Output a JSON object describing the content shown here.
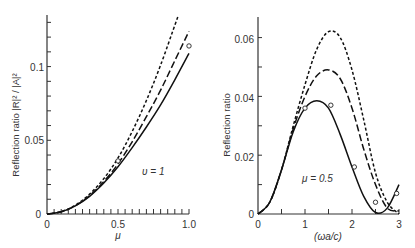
{
  "chart_data": [
    {
      "type": "line",
      "title": "",
      "xlabel": "μ",
      "ylabel": "Reflection ratio |R|² / |A|²",
      "xlim": [
        0,
        1.0
      ],
      "ylim": [
        0,
        0.135
      ],
      "x_ticks": [
        "0",
        "0.5",
        "1.0"
      ],
      "y_ticks": [
        "0",
        "0.05",
        "0.1"
      ],
      "grid": false,
      "annotation": "υ = 1",
      "x": [
        0,
        0.1,
        0.2,
        0.3,
        0.4,
        0.5,
        0.6,
        0.7,
        0.8,
        0.9,
        1.0
      ],
      "series": [
        {
          "name": "solid",
          "style": "solid",
          "values": [
            0,
            0.0015,
            0.0055,
            0.012,
            0.021,
            0.032,
            0.045,
            0.059,
            0.074,
            0.091,
            0.109
          ]
        },
        {
          "name": "long-dash",
          "style": "long-dash",
          "values": [
            0,
            0.0015,
            0.0056,
            0.0125,
            0.022,
            0.034,
            0.049,
            0.066,
            0.084,
            0.104,
            0.124
          ]
        },
        {
          "name": "short-dash",
          "style": "short-dash",
          "values": [
            0,
            0.0016,
            0.006,
            0.0135,
            0.024,
            0.038,
            0.056,
            0.077,
            0.101,
            0.128,
            null
          ]
        }
      ],
      "points": [
        {
          "x": 0.5,
          "y": 0.036
        },
        {
          "x": 1.0,
          "y": 0.114
        }
      ]
    },
    {
      "type": "line",
      "title": "",
      "xlabel": "(ωa/c)",
      "ylabel": "Reflection ratio",
      "xlim": [
        0,
        3
      ],
      "ylim": [
        0,
        0.067
      ],
      "x_ticks": [
        "0",
        "1",
        "2",
        "3"
      ],
      "y_ticks": [
        "0",
        "0.02",
        "0.04",
        "0.06"
      ],
      "grid": false,
      "annotation": "μ = 0.5",
      "x": [
        0,
        0.25,
        0.5,
        0.75,
        1.0,
        1.25,
        1.5,
        1.75,
        2.0,
        2.25,
        2.5,
        2.75,
        3.0
      ],
      "series": [
        {
          "name": "solid",
          "style": "solid",
          "values": [
            0,
            0.004,
            0.015,
            0.028,
            0.036,
            0.0385,
            0.036,
            0.027,
            0.016,
            0.006,
            0.0005,
            0.002,
            0.01
          ]
        },
        {
          "name": "long-dash",
          "style": "long-dash",
          "values": [
            0,
            0.004,
            0.015,
            0.029,
            0.04,
            0.047,
            0.049,
            0.046,
            0.036,
            0.022,
            0.01,
            0.002,
            0.001
          ]
        },
        {
          "name": "short-dash",
          "style": "short-dash",
          "values": [
            0,
            0.004,
            0.015,
            0.03,
            0.044,
            0.056,
            0.062,
            0.06,
            0.049,
            0.032,
            0.014,
            0.004,
            0.0
          ]
        }
      ],
      "points": [
        {
          "x": 1.0,
          "y": 0.036
        },
        {
          "x": 1.55,
          "y": 0.037
        },
        {
          "x": 2.05,
          "y": 0.016
        },
        {
          "x": 2.5,
          "y": 0.004
        },
        {
          "x": 2.95,
          "y": 0.007
        }
      ]
    }
  ]
}
